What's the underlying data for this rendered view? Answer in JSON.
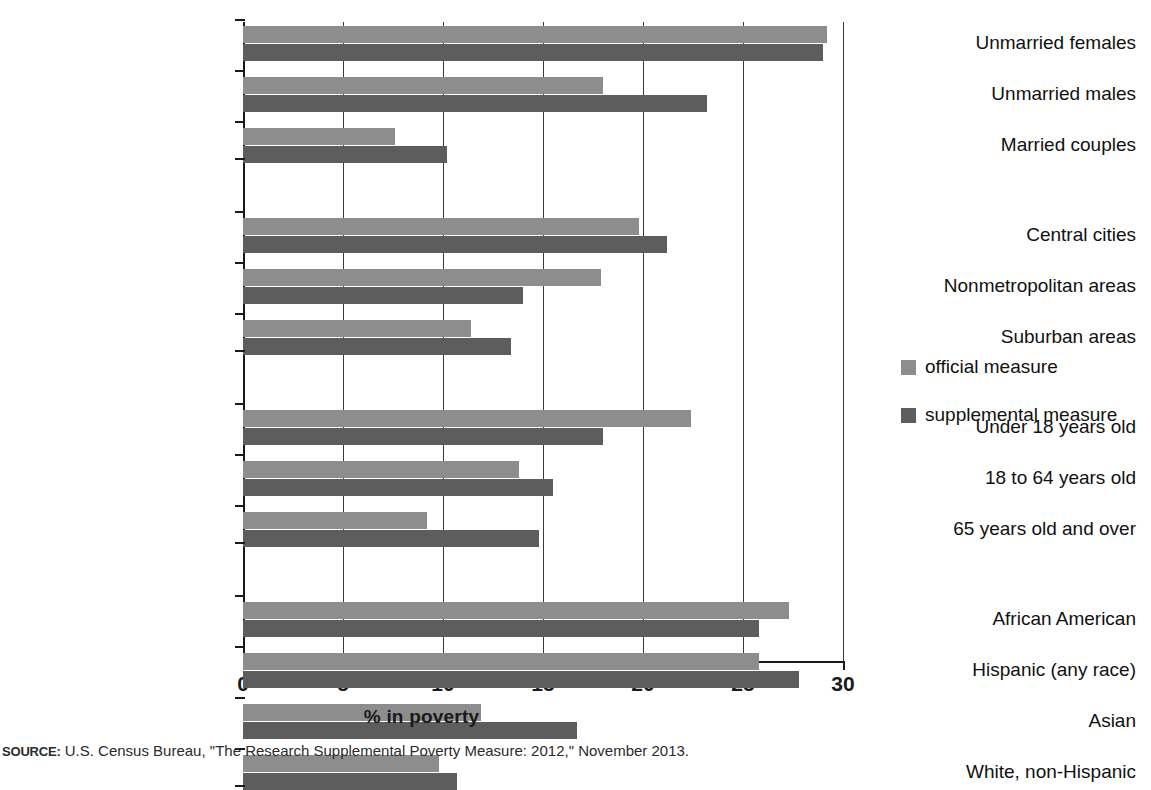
{
  "chart_data": {
    "type": "bar",
    "orientation": "horizontal",
    "title": "",
    "xlabel": "% in poverty",
    "ylabel": "",
    "xlim": [
      0,
      30
    ],
    "xticks": [
      0,
      5,
      10,
      15,
      20,
      25,
      30
    ],
    "grid": true,
    "legend_position": "right",
    "series": [
      {
        "name": "official measure",
        "color": "#8d8d8d"
      },
      {
        "name": "supplemental measure",
        "color": "#5d5d5d"
      }
    ],
    "groups": [
      {
        "name": "family-type",
        "categories": [
          {
            "label": "Unmarried females",
            "official": 29.2,
            "supplemental": 29.0
          },
          {
            "label": "Unmarried males",
            "official": 18.0,
            "supplemental": 23.2
          },
          {
            "label": "Married couples",
            "official": 7.6,
            "supplemental": 10.2
          }
        ]
      },
      {
        "name": "residence",
        "categories": [
          {
            "label": "Central cities",
            "official": 19.8,
            "supplemental": 21.2
          },
          {
            "label": "Nonmetropolitan areas",
            "official": 17.9,
            "supplemental": 14.0
          },
          {
            "label": "Suburban areas",
            "official": 11.4,
            "supplemental": 13.4
          }
        ]
      },
      {
        "name": "age",
        "categories": [
          {
            "label": "Under 18 years old",
            "official": 22.4,
            "supplemental": 18.0
          },
          {
            "label": "18 to 64 years old",
            "official": 13.8,
            "supplemental": 15.5
          },
          {
            "label": "65 years old and over",
            "official": 9.2,
            "supplemental": 14.8
          }
        ]
      },
      {
        "name": "race-ethnicity",
        "categories": [
          {
            "label": "African American",
            "official": 27.3,
            "supplemental": 25.8
          },
          {
            "label": "Hispanic (any race)",
            "official": 25.8,
            "supplemental": 27.8
          },
          {
            "label": "Asian",
            "official": 11.9,
            "supplemental": 16.7
          },
          {
            "label": "White, non-Hispanic",
            "official": 9.8,
            "supplemental": 10.7
          }
        ]
      }
    ]
  },
  "legend": {
    "items": [
      {
        "label": "official measure",
        "color": "#8d8d8d"
      },
      {
        "label": "supplemental measure",
        "color": "#5d5d5d"
      }
    ]
  },
  "axis": {
    "x_label": "% in poverty",
    "x_tick_labels": [
      "0",
      "5",
      "10",
      "15",
      "20",
      "25",
      "30"
    ]
  },
  "source": {
    "label": "SOURCE:",
    "text": " U.S. Census Bureau, \"The Research Supplemental Poverty Measure: 2012,\" November 2013."
  }
}
